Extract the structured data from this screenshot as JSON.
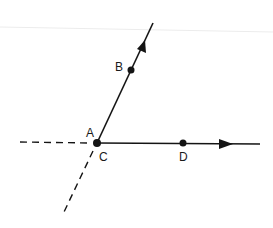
{
  "diagram": {
    "type": "geometry-rays",
    "points": [
      {
        "id": "A",
        "label": "A",
        "x": 97,
        "y": 143,
        "label_x": 86,
        "label_y": 135
      },
      {
        "id": "B",
        "label": "B",
        "x": 131,
        "y": 70,
        "label_x": 115,
        "label_y": 70
      },
      {
        "id": "C",
        "label": "C",
        "x": 97,
        "y": 143,
        "label_x": 99,
        "label_y": 161
      },
      {
        "id": "D",
        "label": "D",
        "x": 183,
        "y": 143,
        "label_x": 179,
        "label_y": 161
      }
    ],
    "rays": [
      {
        "name": "ray-AB",
        "from": "A",
        "through": "B",
        "direction": "up-right"
      },
      {
        "name": "ray-CD",
        "from": "C",
        "through": "D",
        "direction": "right"
      }
    ],
    "dashed_extensions": [
      {
        "name": "extension-left-horizontal",
        "direction": "left"
      },
      {
        "name": "extension-down-left-diagonal",
        "direction": "down-left"
      }
    ],
    "colors": {
      "ink": "#141414",
      "background": "#ffffff"
    }
  }
}
